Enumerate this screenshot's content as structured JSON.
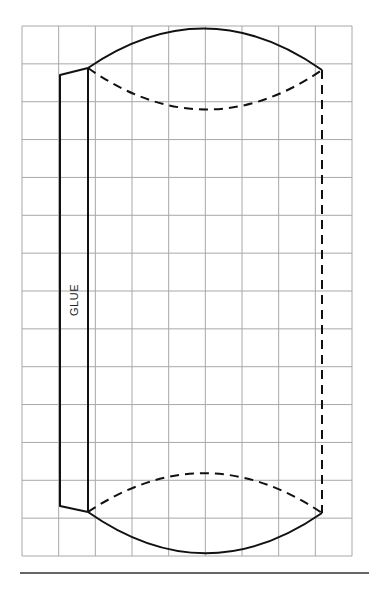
{
  "diagram": {
    "type": "pillow-box template",
    "glue_label": "GLUE",
    "grid": {
      "left": 22,
      "right": 352,
      "top": 26,
      "bottom": 556,
      "columns": 9,
      "rows": 14,
      "line_color": "#a8a8a8"
    },
    "line_color": "#111111",
    "glue_tab": {
      "points": [
        [
          88,
          68
        ],
        [
          60,
          75
        ],
        [
          60,
          506
        ],
        [
          88,
          512
        ]
      ]
    },
    "fold_line_left": {
      "x": 88,
      "y1": 68,
      "y2": 512
    },
    "fold_line_right": {
      "x": 322,
      "y1": 70,
      "y2": 513,
      "style": "dashed"
    },
    "top_cut_arc": {
      "from": [
        88,
        68
      ],
      "control": [
        205,
        -12
      ],
      "to": [
        322,
        70
      ]
    },
    "top_fold_arc": {
      "from": [
        88,
        68
      ],
      "control": [
        205,
        150
      ],
      "to": [
        322,
        70
      ]
    },
    "bottom_fold_arc": {
      "from": [
        88,
        512
      ],
      "control": [
        205,
        434
      ],
      "to": [
        322,
        513
      ]
    },
    "bottom_cut_arc": {
      "from": [
        88,
        512
      ],
      "control": [
        205,
        594
      ],
      "to": [
        322,
        513
      ]
    },
    "bottom_rule": {
      "x1": 20,
      "x2": 369,
      "y": 573
    }
  }
}
